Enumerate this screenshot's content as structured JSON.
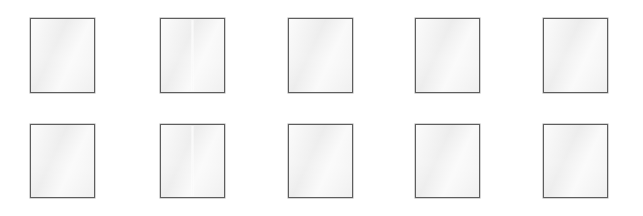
{
  "canvas": {
    "width": 643,
    "height": 216,
    "background_color": "#ffffff",
    "description": "Blank placeholder thumbnail grid"
  },
  "style": {
    "tile_fill_color": "#eeeeee",
    "tile_border_color": "#5e5e5e",
    "tile_border_width_px": 1
  },
  "grid": {
    "columns": 5,
    "rows": 2,
    "tile_width_px": 65,
    "row_heights_px": [
      75,
      74
    ],
    "column_left_edges_px": [
      30,
      160,
      288,
      415,
      543
    ],
    "row_top_edges_px": [
      18,
      124
    ]
  },
  "tiles": [
    {
      "id": "tile-r1c1",
      "row": 1,
      "col": 1,
      "x": 30,
      "y": 18,
      "w": 65,
      "h": 75,
      "label": "",
      "crease": false
    },
    {
      "id": "tile-r1c2",
      "row": 1,
      "col": 2,
      "x": 160,
      "y": 18,
      "w": 65,
      "h": 75,
      "label": "",
      "crease": true
    },
    {
      "id": "tile-r1c3",
      "row": 1,
      "col": 3,
      "x": 288,
      "y": 18,
      "w": 65,
      "h": 75,
      "label": "",
      "crease": false
    },
    {
      "id": "tile-r1c4",
      "row": 1,
      "col": 4,
      "x": 415,
      "y": 18,
      "w": 65,
      "h": 75,
      "label": "",
      "crease": false
    },
    {
      "id": "tile-r1c5",
      "row": 1,
      "col": 5,
      "x": 543,
      "y": 18,
      "w": 65,
      "h": 75,
      "label": "",
      "crease": false
    },
    {
      "id": "tile-r2c1",
      "row": 2,
      "col": 1,
      "x": 30,
      "y": 124,
      "w": 65,
      "h": 74,
      "label": "",
      "crease": false
    },
    {
      "id": "tile-r2c2",
      "row": 2,
      "col": 2,
      "x": 160,
      "y": 124,
      "w": 65,
      "h": 74,
      "label": "",
      "crease": true
    },
    {
      "id": "tile-r2c3",
      "row": 2,
      "col": 3,
      "x": 288,
      "y": 124,
      "w": 65,
      "h": 74,
      "label": "",
      "crease": false
    },
    {
      "id": "tile-r2c4",
      "row": 2,
      "col": 4,
      "x": 415,
      "y": 124,
      "w": 65,
      "h": 74,
      "label": "",
      "crease": false
    },
    {
      "id": "tile-r2c5",
      "row": 2,
      "col": 5,
      "x": 543,
      "y": 124,
      "w": 65,
      "h": 74,
      "label": "",
      "crease": false
    }
  ]
}
